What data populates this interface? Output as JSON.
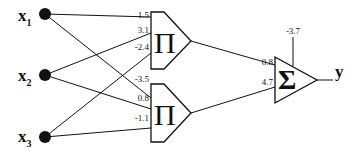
{
  "inputs": [
    {
      "name": "x",
      "sub": "1"
    },
    {
      "name": "x",
      "sub": "2"
    },
    {
      "name": "x",
      "sub": "3"
    }
  ],
  "product_units": [
    {
      "symbol": "Π",
      "weights": [
        "1.5",
        "3.1",
        "-2.4"
      ]
    },
    {
      "symbol": "Π",
      "weights": [
        "-3.5",
        "0.8",
        "-1.1"
      ]
    }
  ],
  "sum_unit": {
    "symbol": "Σ",
    "weights": [
      "0.8",
      "4.7"
    ],
    "bias": "-3.7"
  },
  "output": {
    "label": "y"
  },
  "colors": {
    "stroke": "#111111",
    "background": "#ffffff"
  }
}
